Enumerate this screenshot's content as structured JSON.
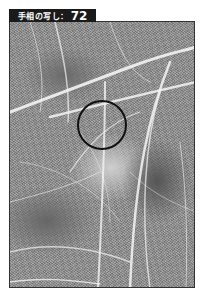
{
  "label": {
    "text": "手相の写し：",
    "number": "72"
  },
  "photo": {
    "subject": "palm-print-photograph",
    "colors": {
      "background": "#ffffff",
      "label_bg": "#1a1a1a",
      "label_fg": "#ffffff",
      "circle": "#111111"
    }
  },
  "annotation": {
    "shape": "circle"
  }
}
